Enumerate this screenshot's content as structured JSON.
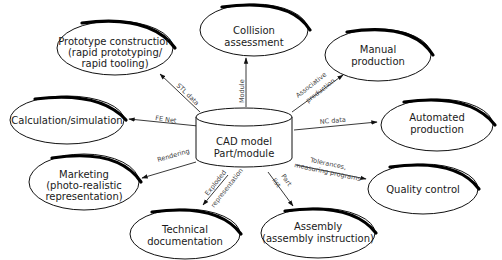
{
  "diagram": {
    "center": {
      "shape": "cylinder",
      "lines": [
        "CAD model",
        "Part/module"
      ]
    },
    "nodes": [
      {
        "id": "prototype",
        "lines": [
          "Prototype construction",
          "(rapid prototyping/",
          "rapid tooling)"
        ]
      },
      {
        "id": "collision",
        "lines": [
          "Collision",
          "assessment"
        ]
      },
      {
        "id": "manual",
        "lines": [
          "Manual",
          "production"
        ]
      },
      {
        "id": "calculation",
        "lines": [
          "Calculation/simulation"
        ]
      },
      {
        "id": "automated",
        "lines": [
          "Automated",
          "production"
        ]
      },
      {
        "id": "marketing",
        "lines": [
          "Marketing",
          "(photo-realistic",
          "representation)"
        ]
      },
      {
        "id": "quality",
        "lines": [
          "Quality control"
        ]
      },
      {
        "id": "technical",
        "lines": [
          "Technical",
          "documentation"
        ]
      },
      {
        "id": "assembly",
        "lines": [
          "Assembly",
          "(assembly instruction)"
        ]
      }
    ],
    "edges": [
      {
        "to": "prototype",
        "label": "STL data"
      },
      {
        "to": "collision",
        "label": "Module"
      },
      {
        "to": "manual",
        "lines": [
          "Associative",
          "production"
        ]
      },
      {
        "to": "calculation",
        "label": "FE Net"
      },
      {
        "to": "automated",
        "label": "NC data"
      },
      {
        "to": "marketing",
        "label": "Rendering"
      },
      {
        "to": "quality",
        "lines": [
          "Tolerances,",
          "measuring programs"
        ]
      },
      {
        "to": "technical",
        "lines": [
          "Exploded",
          "representation"
        ]
      },
      {
        "to": "assembly",
        "lines": [
          "Part",
          "list"
        ]
      }
    ]
  }
}
